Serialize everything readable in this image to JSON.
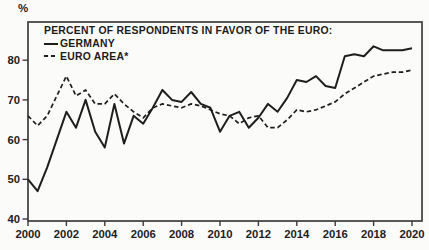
{
  "chart_data": {
    "type": "line",
    "title": "PERCENT OF RESPONDENTS IN FAVOR OF THE EURO:",
    "ylabel": "%",
    "xlabel": "",
    "grid": false,
    "legend_position": "top-left-inside",
    "xlim": [
      2000,
      2020.5
    ],
    "ylim": [
      40,
      85
    ],
    "x_ticks": [
      2000,
      2002,
      2004,
      2006,
      2008,
      2010,
      2012,
      2014,
      2016,
      2018,
      2020
    ],
    "y_ticks": [
      40,
      50,
      60,
      70,
      80
    ],
    "ink_color": "#1e1e1e",
    "frame_color": "#3c3c3c",
    "background_color": "#fbfbf9",
    "x": [
      2000,
      2000.5,
      2001,
      2001.5,
      2002,
      2002.5,
      2003,
      2003.5,
      2004,
      2004.5,
      2005,
      2005.5,
      2006,
      2006.5,
      2007,
      2007.5,
      2008,
      2008.5,
      2009,
      2009.5,
      2010,
      2010.5,
      2011,
      2011.5,
      2012,
      2012.5,
      2013,
      2013.5,
      2014,
      2014.5,
      2015,
      2015.5,
      2016,
      2016.5,
      2017,
      2017.5,
      2018,
      2018.5,
      2019,
      2019.5,
      2020
    ],
    "series": [
      {
        "name": "GERMANY",
        "style": "solid",
        "color": "#1e1e1e",
        "values": [
          50,
          47,
          53,
          60,
          67,
          63,
          70,
          62,
          58,
          69,
          59,
          66,
          64,
          68,
          72.5,
          70,
          69.5,
          72,
          69,
          68,
          62,
          66,
          67,
          63,
          65.5,
          69,
          67,
          70.5,
          75,
          74.5,
          76,
          73.5,
          73,
          81,
          81.5,
          81,
          83.5,
          82.5,
          82.5,
          82.5,
          83
        ]
      },
      {
        "name": "EURO AREA*",
        "style": "dashed",
        "color": "#1e1e1e",
        "values": [
          66,
          63.5,
          66,
          71,
          76,
          71,
          72.5,
          69,
          69,
          71.5,
          69,
          67,
          65.5,
          68,
          69,
          68.5,
          68,
          69,
          68.5,
          67.5,
          66.5,
          66,
          64,
          65.5,
          66,
          63,
          63,
          65,
          67.5,
          67,
          67.5,
          68.5,
          69.5,
          71.5,
          73,
          74.5,
          76,
          76.5,
          77,
          77,
          77.5
        ]
      }
    ]
  }
}
